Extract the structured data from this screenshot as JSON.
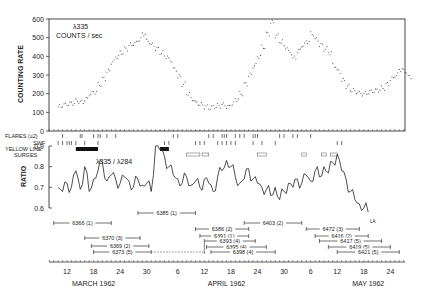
{
  "chart_data": [
    {
      "type": "scatter",
      "title": "λ335 COUNTS/sec",
      "ylabel": "COUNTING RATE",
      "ylim": [
        0,
        600
      ],
      "yticks": [
        0,
        100,
        200,
        300,
        400,
        500,
        600
      ],
      "x_unit": "day offset from March 12, 1962",
      "series": [
        {
          "name": "λ335 counts/sec",
          "x": [
            -2,
            -1,
            0,
            1,
            2,
            3,
            4,
            5,
            6,
            7,
            8,
            9,
            10,
            11,
            12,
            13,
            14,
            15,
            16,
            17,
            18,
            19,
            20,
            21,
            22,
            23,
            24,
            25,
            26,
            27,
            28,
            29,
            30,
            31,
            32,
            33,
            34,
            35,
            36,
            37,
            38,
            39,
            40,
            41,
            42,
            43,
            44,
            45,
            46,
            47,
            48,
            49,
            50,
            51,
            52,
            53,
            54,
            55,
            56,
            57,
            58,
            59,
            60,
            61,
            62,
            63,
            64,
            65,
            66,
            67,
            68,
            69,
            70,
            71,
            72,
            73,
            74,
            75,
            76,
            77
          ],
          "values": [
            130,
            140,
            145,
            150,
            160,
            155,
            170,
            200,
            210,
            250,
            280,
            320,
            370,
            400,
            420,
            440,
            460,
            470,
            490,
            520,
            480,
            460,
            440,
            420,
            400,
            380,
            330,
            290,
            250,
            200,
            170,
            150,
            140,
            130,
            125,
            130,
            135,
            140,
            130,
            145,
            170,
            200,
            250,
            300,
            350,
            400,
            450,
            520,
            580,
            510,
            480,
            450,
            420,
            390,
            430,
            460,
            480,
            520,
            490,
            460,
            440,
            420,
            350,
            320,
            270,
            240,
            220,
            210,
            200,
            200,
            210,
            215,
            220,
            230,
            250,
            280,
            300,
            330,
            320,
            290
          ]
        }
      ]
    },
    {
      "type": "line",
      "title": "λ335 / λ284",
      "ylabel": "RATIO",
      "ylim": [
        0.6,
        0.9
      ],
      "yticks": [
        0.6,
        0.7,
        0.8,
        0.9
      ],
      "x_unit": "day offset from March 12, 1962",
      "series": [
        {
          "name": "λ335/λ284",
          "x": [
            -2,
            -1,
            0,
            1,
            2,
            3,
            4,
            5,
            6,
            7,
            8,
            9,
            10,
            11,
            12,
            13,
            14,
            15,
            16,
            17,
            18,
            19,
            20,
            21,
            22,
            23,
            24,
            25,
            26,
            27,
            28,
            29,
            30,
            31,
            32,
            33,
            34,
            35,
            36,
            37,
            38,
            39,
            40,
            41,
            42,
            43,
            44,
            45,
            46,
            47,
            48,
            49,
            50,
            51,
            52,
            53,
            54,
            55,
            56,
            57,
            58,
            59,
            60,
            61,
            62,
            63,
            64,
            65,
            66,
            67,
            68
          ],
          "values": [
            0.7,
            0.68,
            0.72,
            0.7,
            0.78,
            0.69,
            0.8,
            0.68,
            0.74,
            0.78,
            0.82,
            0.73,
            0.76,
            0.74,
            0.72,
            0.75,
            0.73,
            0.7,
            0.74,
            0.71,
            0.72,
            0.68,
            0.9,
            0.88,
            0.85,
            0.8,
            0.76,
            0.74,
            0.72,
            0.75,
            0.71,
            0.73,
            0.7,
            0.74,
            0.72,
            0.68,
            0.75,
            0.78,
            0.83,
            0.8,
            0.75,
            0.72,
            0.74,
            0.79,
            0.74,
            0.72,
            0.7,
            0.69,
            0.66,
            0.7,
            0.64,
            0.68,
            0.72,
            0.7,
            0.74,
            0.72,
            0.76,
            0.73,
            0.78,
            0.75,
            0.8,
            0.77,
            0.82,
            0.86,
            0.78,
            0.74,
            0.68,
            0.64,
            0.62,
            0.6,
            0.58
          ]
        }
      ]
    }
  ],
  "x_axis": {
    "ticks": [
      {
        "label": "12",
        "day": 0
      },
      {
        "label": "18",
        "day": 6
      },
      {
        "label": "24",
        "day": 12
      },
      {
        "label": "30",
        "day": 18
      },
      {
        "label": "6",
        "day": 25
      },
      {
        "label": "12",
        "day": 31
      },
      {
        "label": "18",
        "day": 37
      },
      {
        "label": "24",
        "day": 43
      },
      {
        "label": "30",
        "day": 49
      },
      {
        "label": "6",
        "day": 55
      },
      {
        "label": "12",
        "day": 61
      },
      {
        "label": "18",
        "day": 67
      },
      {
        "label": "24",
        "day": 73
      }
    ],
    "months": [
      {
        "label": "MARCH  1962",
        "day": 6
      },
      {
        "label": "APRIL  1962",
        "day": 36
      },
      {
        "label": "MAY  1962",
        "day": 68
      }
    ]
  },
  "event_bands": {
    "flares_label": "FLARES (≥2)",
    "swf_label": "SWF",
    "yellow_label": "YELLOW LINE",
    "surges_label": "SURGES",
    "flares": [
      -1,
      3,
      3.4,
      6,
      7,
      7.5,
      9,
      11,
      24,
      25,
      32,
      33,
      35,
      35.5,
      36,
      38,
      39,
      40,
      42,
      42.5,
      43,
      48,
      49,
      51,
      52,
      55
    ],
    "swf": [
      -2,
      -1,
      0,
      0.5,
      1,
      2,
      4,
      7,
      22,
      23,
      29,
      30,
      31,
      34,
      35,
      36,
      37,
      38,
      42,
      44,
      47,
      61,
      62
    ],
    "yellow": [
      {
        "start": 2,
        "end": 7
      },
      {
        "start": 21,
        "end": 23
      }
    ],
    "surges": [
      {
        "start": 27,
        "end": 30
      },
      {
        "start": 30.5,
        "end": 32
      },
      {
        "start": 43,
        "end": 45
      },
      {
        "start": 53,
        "end": 54
      },
      {
        "start": 57.5,
        "end": 58.5
      },
      {
        "start": 59.5,
        "end": 61
      }
    ]
  },
  "regions": [
    {
      "label": "6366 (1)",
      "start": -3,
      "end": 10
    },
    {
      "label": "6370 (3)",
      "start": 4,
      "end": 16.5
    },
    {
      "label": "6369 (2)",
      "start": 5.5,
      "end": 18.5
    },
    {
      "label": "6373 (5)",
      "start": 6,
      "end": 19,
      "dashed_to": 31
    },
    {
      "label": "6385 (1)",
      "start": 16,
      "end": 29
    },
    {
      "label": "6386 (2)",
      "start": 29,
      "end": 41
    },
    {
      "label": "6391 (1)",
      "start": 30,
      "end": 41
    },
    {
      "label": "6393 (4)",
      "start": 31,
      "end": 42.5
    },
    {
      "label": "6395 (4)",
      "start": 31.5,
      "end": 45
    },
    {
      "label": "6398 (4)",
      "start": 32.5,
      "end": 47
    },
    {
      "label": "6403 (2)",
      "start": 40,
      "end": 53
    },
    {
      "label": "6472 (3)",
      "start": 54,
      "end": 66
    },
    {
      "label": "6416 (2)",
      "start": 56,
      "end": 68
    },
    {
      "label": "6417 (5)",
      "start": 57,
      "end": 71
    },
    {
      "label": "6419 (5)",
      "start": 59,
      "end": 73
    },
    {
      "label": "6421 (5)",
      "start": 61,
      "end": 75
    }
  ],
  "annotations": {
    "top_title_line1": "λ335",
    "top_title_line2": "COUNTS / sec",
    "ratio_title": "λ335 / λ284",
    "top_ylabel": "COUNTING RATE",
    "ratio_ylabel": "RATIO",
    "end_label": "LA"
  }
}
